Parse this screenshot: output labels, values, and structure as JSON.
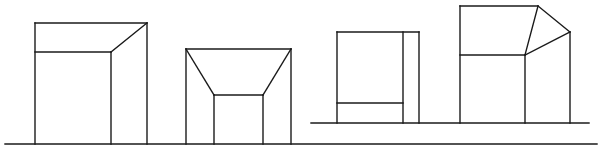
{
  "diagram": {
    "type": "line-drawing",
    "stroke_color": "#1a1a1a",
    "background": "#ffffff",
    "ground_lines": [
      {
        "id": "ground-main",
        "x1": 5,
        "y1": 144,
        "x2": 597,
        "y2": 144
      },
      {
        "id": "ground-secondary",
        "x1": 311,
        "y1": 123,
        "x2": 589,
        "y2": 123
      }
    ],
    "figures": [
      {
        "id": "figure-1",
        "segments": [
          [
            35,
            23,
            147,
            23
          ],
          [
            35,
            23,
            35,
            144
          ],
          [
            147,
            23,
            147,
            144
          ],
          [
            35,
            52,
            111,
            52
          ],
          [
            111,
            52,
            111,
            144
          ],
          [
            111,
            52,
            147,
            23
          ]
        ]
      },
      {
        "id": "figure-2",
        "segments": [
          [
            186,
            49,
            291,
            49
          ],
          [
            186,
            49,
            186,
            144
          ],
          [
            291,
            49,
            291,
            144
          ],
          [
            186,
            49,
            214,
            95
          ],
          [
            291,
            49,
            263,
            95
          ],
          [
            214,
            95,
            263,
            95
          ],
          [
            214,
            95,
            214,
            144
          ],
          [
            263,
            95,
            263,
            144
          ]
        ]
      },
      {
        "id": "figure-3",
        "segments": [
          [
            337,
            32,
            419,
            32
          ],
          [
            337,
            32,
            337,
            123
          ],
          [
            419,
            32,
            419,
            123
          ],
          [
            403,
            32,
            403,
            123
          ],
          [
            337,
            103,
            403,
            103
          ]
        ]
      },
      {
        "id": "figure-4",
        "segments": [
          [
            460,
            6,
            538,
            6
          ],
          [
            460,
            6,
            460,
            123
          ],
          [
            460,
            55,
            525,
            55
          ],
          [
            525,
            55,
            525,
            123
          ],
          [
            538,
            6,
            525,
            55
          ],
          [
            538,
            6,
            570,
            32
          ],
          [
            525,
            55,
            570,
            32
          ],
          [
            570,
            32,
            570,
            123
          ]
        ]
      }
    ]
  }
}
